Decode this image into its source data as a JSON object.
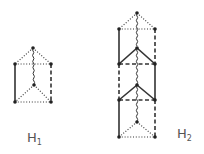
{
  "figures": [
    {
      "id": "H1",
      "label": "H",
      "subscript": "1",
      "vertices": {
        "top": [
          33,
          48
        ],
        "lt": [
          15,
          64
        ],
        "rt": [
          51,
          64
        ],
        "mid": [
          34,
          85
        ],
        "lb": [
          15,
          102
        ],
        "rb": [
          51,
          102
        ]
      },
      "edges": [
        {
          "a": "top",
          "b": "lt",
          "style": "dotted"
        },
        {
          "a": "top",
          "b": "rt",
          "style": "dotted"
        },
        {
          "a": "lt",
          "b": "rt",
          "style": "dotted"
        },
        {
          "a": "top",
          "b": "mid",
          "style": "wavy"
        },
        {
          "a": "lt",
          "b": "lb",
          "style": "solid"
        },
        {
          "a": "rt",
          "b": "rb",
          "style": "dashed"
        },
        {
          "a": "mid",
          "b": "lb",
          "style": "dotted"
        },
        {
          "a": "mid",
          "b": "rb",
          "style": "dotted"
        },
        {
          "a": "lb",
          "b": "rb",
          "style": "dotted"
        }
      ]
    },
    {
      "id": "H2",
      "label": "H",
      "subscript": "2",
      "vertices": {
        "top": [
          137,
          13
        ],
        "l1": [
          119,
          29
        ],
        "r1": [
          155,
          29
        ],
        "m1": [
          137,
          48
        ],
        "l2": [
          119,
          64
        ],
        "r2": [
          155,
          64
        ],
        "m2": [
          137,
          85
        ],
        "l3": [
          119,
          100
        ],
        "r3": [
          155,
          100
        ],
        "m3": [
          137,
          122
        ],
        "l4": [
          119,
          137
        ],
        "r4": [
          155,
          137
        ]
      },
      "edges": [
        {
          "a": "top",
          "b": "l1",
          "style": "dotted"
        },
        {
          "a": "top",
          "b": "r1",
          "style": "dotted"
        },
        {
          "a": "l1",
          "b": "r1",
          "style": "dotted"
        },
        {
          "a": "top",
          "b": "m1",
          "style": "wavy"
        },
        {
          "a": "l1",
          "b": "l2",
          "style": "solid"
        },
        {
          "a": "r1",
          "b": "r2",
          "style": "dashed"
        },
        {
          "a": "m1",
          "b": "l2",
          "style": "solid"
        },
        {
          "a": "m1",
          "b": "r2",
          "style": "solid"
        },
        {
          "a": "l2",
          "b": "r2",
          "style": "dashed"
        },
        {
          "a": "m1",
          "b": "m2",
          "style": "wavy"
        },
        {
          "a": "l2",
          "b": "l3",
          "style": "dashed"
        },
        {
          "a": "r2",
          "b": "r3",
          "style": "solid"
        },
        {
          "a": "m2",
          "b": "l3",
          "style": "solid"
        },
        {
          "a": "m2",
          "b": "r3",
          "style": "solid"
        },
        {
          "a": "l3",
          "b": "r3",
          "style": "dashed"
        },
        {
          "a": "m2",
          "b": "m3",
          "style": "wavy"
        },
        {
          "a": "l3",
          "b": "l4",
          "style": "solid"
        },
        {
          "a": "r3",
          "b": "r4",
          "style": "dashed"
        },
        {
          "a": "m3",
          "b": "l4",
          "style": "dotted"
        },
        {
          "a": "m3",
          "b": "r4",
          "style": "dotted"
        },
        {
          "a": "l4",
          "b": "r4",
          "style": "dotted"
        }
      ]
    }
  ],
  "labels": {
    "h1": {
      "text": "H",
      "sub": "1",
      "x": 27,
      "y": 142
    },
    "h2": {
      "text": "H",
      "sub": "2",
      "x": 177,
      "y": 138
    }
  },
  "colors": {
    "stroke": "#333333",
    "vertex": "#222222"
  }
}
